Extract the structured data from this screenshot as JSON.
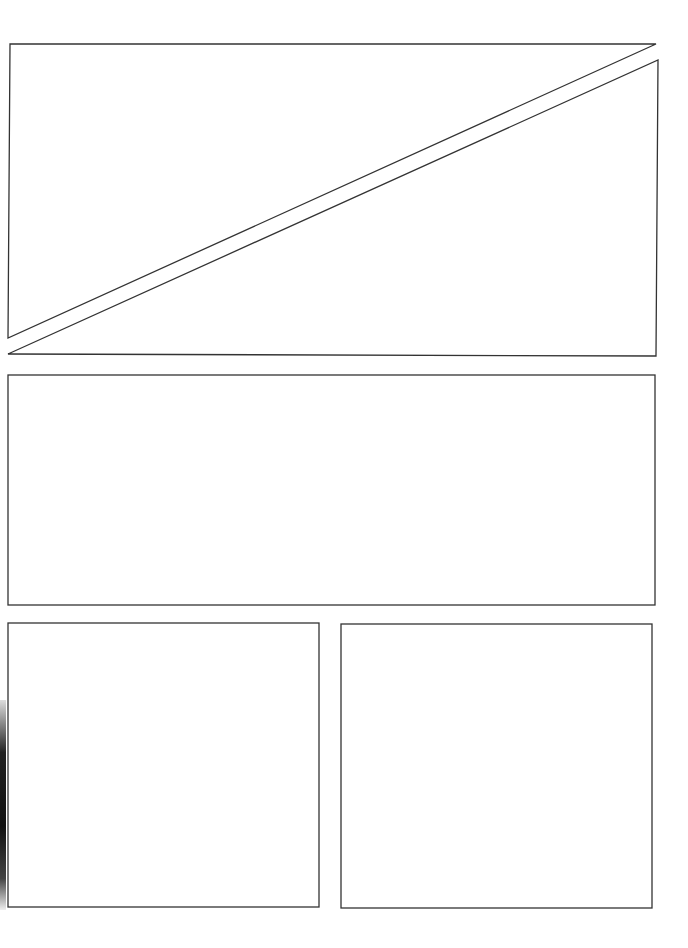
{
  "page": {
    "type": "blank comic page template",
    "width": 688,
    "height": 948,
    "background": "#ffffff",
    "stroke": "#333333"
  },
  "panels": [
    {
      "id": "panel-1-upper-triangle",
      "points": "10,44 656,44 8,338"
    },
    {
      "id": "panel-2-lower-triangle",
      "points": "658,60 656,356 8,354"
    },
    {
      "id": "panel-3-wide",
      "x": 8,
      "y": 375,
      "w": 647,
      "h": 230
    },
    {
      "id": "panel-4-bottom-left",
      "x": 8,
      "y": 623,
      "w": 311,
      "h": 284
    },
    {
      "id": "panel-5-bottom-right",
      "x": 341,
      "y": 624,
      "w": 311,
      "h": 284
    }
  ]
}
